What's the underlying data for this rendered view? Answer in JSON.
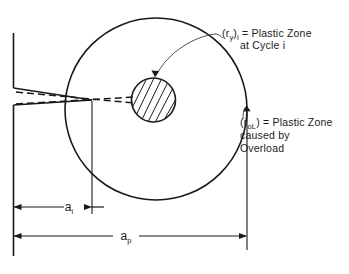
{
  "figure": {
    "background_color": "#ffffff",
    "ink_color": "#1a1a1a"
  },
  "annotations": {
    "plastic_zone_cycle": {
      "symbol_open": "(r",
      "symbol_sub": "y",
      "symbol_close": ")",
      "symbol_sub2": "i",
      "equals": " = Plastic Zone",
      "line2": "at Cycle i",
      "full_text": "(r_y)_i = Plastic Zone at Cycle i"
    },
    "plastic_zone_overload": {
      "symbol_open": "(r",
      "symbol_sub": "oL",
      "symbol_close": ")",
      "equals": " = Plastic Zone",
      "line2": "caused by",
      "line3": "Overload",
      "full_text": "(r_oL) = Plastic Zone caused by Overload"
    }
  },
  "dimensions": [
    {
      "id": "a-i",
      "label": "a",
      "subscript": "i",
      "x_start": 13,
      "x_end": 92,
      "y": 207
    },
    {
      "id": "a-p",
      "label": "a",
      "subscript": "p",
      "x_start": 13,
      "x_end": 247,
      "y": 236
    }
  ],
  "geometry": {
    "large_circle": {
      "cx": 156,
      "cy": 109,
      "r": 91,
      "name": "overload-plastic-zone"
    },
    "small_circle": {
      "cx": 153.5,
      "cy": 100,
      "r": 22,
      "name": "cycle-plastic-zone"
    },
    "crack_tip_x": 92,
    "specimen_edge_x": 13
  }
}
